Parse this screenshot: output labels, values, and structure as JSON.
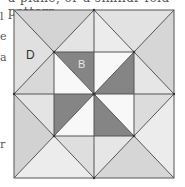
{
  "figure": {
    "caption_fragment": "a plane, or a similar fold pattern",
    "labels": {
      "D": "D",
      "B": "B"
    },
    "colors": {
      "line": "#555555",
      "dark": "#858585",
      "white": "#f8f8f8",
      "light1": "#d9d9d9",
      "light2": "#e6e6e6",
      "light3": "#cfcfcf"
    },
    "margin_marks": [
      "l",
      "e",
      "a",
      "r"
    ]
  }
}
